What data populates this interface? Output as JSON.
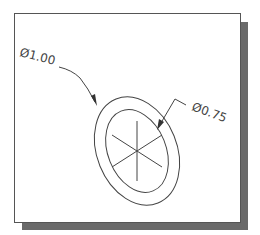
{
  "drawing": {
    "type": "technical-drawing",
    "dimensions": [
      {
        "id": "outer",
        "label": "Ø1.00",
        "feature": "outer-ellipse"
      },
      {
        "id": "inner",
        "label": "Ø0.75",
        "feature": "inner-ellipse"
      }
    ],
    "colors": {
      "line": "#444444",
      "frame": "#555555",
      "shadow": "#6a6a6a",
      "background": "#ffffff"
    }
  }
}
